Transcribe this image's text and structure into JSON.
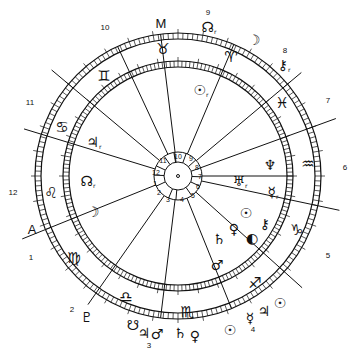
{
  "chart": {
    "center": [
      178,
      176
    ],
    "radii": {
      "outer": 143,
      "outer_inner": 137,
      "inner": 115,
      "inner_inner": 109,
      "house_ring": 24,
      "hub": 14
    },
    "angles": {
      "ascendant": "A",
      "midheaven": "M"
    }
  },
  "outer_house_numbers": [
    {
      "label": "10",
      "x": 105,
      "y": 28
    },
    {
      "label": "9",
      "x": 208,
      "y": 13
    },
    {
      "label": "8",
      "x": 285,
      "y": 51
    },
    {
      "label": "7",
      "x": 328,
      "y": 101
    },
    {
      "label": "6",
      "x": 345,
      "y": 168
    },
    {
      "label": "5",
      "x": 328,
      "y": 256
    },
    {
      "label": "4",
      "x": 253,
      "y": 330
    },
    {
      "label": "3",
      "x": 149,
      "y": 346
    },
    {
      "label": "2",
      "x": 72,
      "y": 310
    },
    {
      "label": "1",
      "x": 31,
      "y": 258
    },
    {
      "label": "12",
      "x": 13,
      "y": 193
    },
    {
      "label": "11",
      "x": 30,
      "y": 103
    }
  ],
  "inner_house_numbers": [
    {
      "label": "10",
      "x": 178,
      "y": 156
    },
    {
      "label": "9",
      "x": 191,
      "y": 158
    },
    {
      "label": "8",
      "x": 197,
      "y": 167
    },
    {
      "label": "7",
      "x": 200,
      "y": 176
    },
    {
      "label": "6",
      "x": 198,
      "y": 186
    },
    {
      "label": "5",
      "x": 193,
      "y": 195
    },
    {
      "label": "4",
      "x": 182,
      "y": 199
    },
    {
      "label": "3",
      "x": 168,
      "y": 199
    },
    {
      "label": "2",
      "x": 159,
      "y": 192
    },
    {
      "label": "1",
      "x": 155,
      "y": 183
    },
    {
      "label": "12",
      "x": 156,
      "y": 172
    },
    {
      "label": "11",
      "x": 163,
      "y": 160
    }
  ],
  "signs": [
    {
      "name": "taurus",
      "glyph": "♉",
      "x": 163,
      "y": 49
    },
    {
      "name": "aries",
      "glyph": "♈",
      "x": 231,
      "y": 57
    },
    {
      "name": "pisces",
      "glyph": "♓",
      "x": 282,
      "y": 103
    },
    {
      "name": "aquarius",
      "glyph": "♒",
      "x": 308,
      "y": 164
    },
    {
      "name": "capricorn",
      "glyph": "♑",
      "x": 297,
      "y": 230
    },
    {
      "name": "sagittarius",
      "glyph": "♐",
      "x": 255,
      "y": 283
    },
    {
      "name": "scorpio",
      "glyph": "♏",
      "x": 187,
      "y": 312
    },
    {
      "name": "libra",
      "glyph": "♎",
      "x": 126,
      "y": 297
    },
    {
      "name": "virgo",
      "glyph": "♍",
      "x": 74,
      "y": 258
    },
    {
      "name": "leo",
      "glyph": "♌",
      "x": 51,
      "y": 193
    },
    {
      "name": "cancer",
      "glyph": "♋",
      "x": 62,
      "y": 127
    },
    {
      "name": "gemini",
      "glyph": "♊",
      "x": 104,
      "y": 76
    }
  ],
  "inner_planets": [
    {
      "name": "jupiter",
      "glyph": "♃",
      "retro": "r",
      "x": 94,
      "y": 142
    },
    {
      "name": "north-node",
      "glyph": "☊",
      "retro": "r",
      "x": 88,
      "y": 181
    },
    {
      "name": "moon",
      "glyph": "☽",
      "retro": "",
      "x": 93,
      "y": 212
    },
    {
      "name": "sun-transit",
      "glyph": "☉",
      "retro": "r",
      "x": 201,
      "y": 90
    },
    {
      "name": "neptune",
      "glyph": "♆",
      "retro": "",
      "x": 270,
      "y": 165
    },
    {
      "name": "uranus",
      "glyph": "♅",
      "retro": "r",
      "x": 240,
      "y": 181
    },
    {
      "name": "mercury",
      "glyph": "☿",
      "retro": "r",
      "x": 273,
      "y": 192
    },
    {
      "name": "sun",
      "glyph": "☉",
      "retro": "",
      "x": 246,
      "y": 213
    },
    {
      "name": "chiron",
      "glyph": "⚷",
      "retro": "",
      "x": 265,
      "y": 224
    },
    {
      "name": "venus",
      "glyph": "♀",
      "retro": "",
      "x": 234,
      "y": 229
    },
    {
      "name": "moon-full",
      "glyph": "◐",
      "retro": "",
      "x": 252,
      "y": 238
    },
    {
      "name": "saturn",
      "glyph": "♄",
      "retro": "",
      "x": 219,
      "y": 239
    },
    {
      "name": "mars",
      "glyph": "♂",
      "retro": "",
      "x": 217,
      "y": 265
    }
  ],
  "outer_planets": [
    {
      "name": "north-node",
      "glyph": "☊",
      "retro": "r",
      "x": 209,
      "y": 27
    },
    {
      "name": "moon",
      "glyph": "☽",
      "retro": "",
      "x": 254,
      "y": 40
    },
    {
      "name": "chiron",
      "glyph": "⚷",
      "retro": "r",
      "x": 284,
      "y": 65
    },
    {
      "name": "sun",
      "glyph": "☉",
      "retro": "",
      "x": 280,
      "y": 303
    },
    {
      "name": "mercury",
      "glyph": "☿",
      "retro": "",
      "x": 250,
      "y": 318
    },
    {
      "name": "jupiter",
      "glyph": "♃",
      "retro": "",
      "x": 264,
      "y": 311
    },
    {
      "name": "sun-2",
      "glyph": "☉",
      "retro": "",
      "x": 230,
      "y": 330
    },
    {
      "name": "pluto",
      "glyph": "♇",
      "retro": "",
      "x": 87,
      "y": 317
    },
    {
      "name": "south-node",
      "glyph": "☋",
      "retro": "",
      "x": 133,
      "y": 325
    },
    {
      "name": "jupiter-2",
      "glyph": "♃",
      "retro": "",
      "x": 144,
      "y": 333
    },
    {
      "name": "mars-2",
      "glyph": "♂",
      "retro": "",
      "x": 157,
      "y": 334
    },
    {
      "name": "saturn",
      "glyph": "♄",
      "retro": "",
      "x": 180,
      "y": 333
    },
    {
      "name": "venus",
      "glyph": "♀",
      "retro": "",
      "x": 195,
      "y": 336
    }
  ],
  "axis_labels": [
    {
      "name": "midheaven",
      "label": "M",
      "x": 161,
      "y": 23
    },
    {
      "name": "ascendant",
      "label": "A",
      "x": 32,
      "y": 229
    }
  ]
}
